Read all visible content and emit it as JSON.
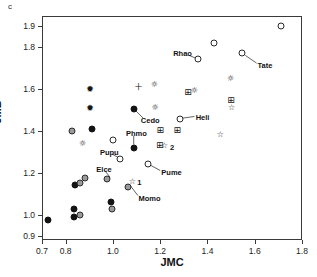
{
  "panel_label": "c",
  "title": "",
  "chart_data": {
    "type": "scatter",
    "title": "",
    "xlabel": "JMC",
    "ylabel": "JMB",
    "xlim": [
      0.7,
      1.8
    ],
    "ylim": [
      0.88,
      1.95
    ],
    "grid": false,
    "legend": "none",
    "xticks": [
      0.7,
      0.8,
      1.0,
      1.2,
      1.4,
      1.6,
      1.8
    ],
    "xtick_labels": [
      "0.7",
      "0.8",
      "1.0",
      "1.2",
      "1.4",
      "1.6",
      "1.8"
    ],
    "yticks": [
      1.9,
      1.8,
      1.6,
      1.4,
      1.2,
      1.0,
      0.9
    ],
    "ytick_labels": [
      "1.9",
      "1.8",
      "1.6",
      "1.4",
      "1.2",
      "1.0",
      "0.9"
    ],
    "marker_types": {
      "circle-filled": "filled black circle",
      "circle-grey": "grey filled circle",
      "circle-open": "open circle",
      "asterisk-filled": "filled asterisk",
      "plus": "plus sign",
      "sun-open": "open sun / gear star",
      "grid-square": "crossed square",
      "star-open": "open five point star"
    },
    "points": [
      {
        "x": 0.725,
        "y": 0.975,
        "marker": "circle-filled",
        "label": ""
      },
      {
        "x": 0.835,
        "y": 1.03,
        "marker": "circle-filled",
        "label": ""
      },
      {
        "x": 0.835,
        "y": 0.99,
        "marker": "circle-filled",
        "label": ""
      },
      {
        "x": 0.838,
        "y": 1.142,
        "marker": "circle-filled",
        "label": ""
      },
      {
        "x": 0.862,
        "y": 0.998,
        "marker": "circle-grey",
        "label": ""
      },
      {
        "x": 0.862,
        "y": 1.15,
        "marker": "circle-grey",
        "label": ""
      },
      {
        "x": 0.88,
        "y": 1.178,
        "marker": "circle-grey",
        "label": ""
      },
      {
        "x": 0.825,
        "y": 1.4,
        "marker": "circle-grey",
        "label": ""
      },
      {
        "x": 0.872,
        "y": 1.338,
        "marker": "sun-open",
        "label": ""
      },
      {
        "x": 0.903,
        "y": 1.512,
        "marker": "asterisk-filled",
        "label": ""
      },
      {
        "x": 0.903,
        "y": 1.6,
        "marker": "asterisk-filled",
        "label": ""
      },
      {
        "x": 0.912,
        "y": 1.408,
        "marker": "circle-filled",
        "label": ""
      },
      {
        "x": 0.998,
        "y": 1.03,
        "marker": "circle-grey",
        "label": ""
      },
      {
        "x": 0.99,
        "y": 1.063,
        "marker": "circle-filled",
        "label": ""
      },
      {
        "x": 0.975,
        "y": 1.17,
        "marker": "circle-grey",
        "label": ""
      },
      {
        "x": 1.0,
        "y": 1.36,
        "marker": "circle-open",
        "label": ""
      },
      {
        "x": 1.028,
        "y": 1.265,
        "marker": "circle-open",
        "label": "Pupu"
      },
      {
        "x": 1.062,
        "y": 1.135,
        "marker": "circle-grey",
        "label": "Momo"
      },
      {
        "x": 1.082,
        "y": 1.155,
        "marker": "star-open",
        "label": "1"
      },
      {
        "x": 1.088,
        "y": 1.32,
        "marker": "circle-filled",
        "label": "Phmo"
      },
      {
        "x": 1.09,
        "y": 1.505,
        "marker": "circle-filled",
        "label": "Cedo"
      },
      {
        "x": 1.108,
        "y": 1.612,
        "marker": "plus",
        "label": ""
      },
      {
        "x": 1.175,
        "y": 1.622,
        "marker": "sun-open",
        "label": ""
      },
      {
        "x": 1.178,
        "y": 1.512,
        "marker": "sun-open",
        "label": ""
      },
      {
        "x": 1.148,
        "y": 1.243,
        "marker": "circle-open",
        "label": "Pume"
      },
      {
        "x": 1.198,
        "y": 1.335,
        "marker": "grid-square",
        "label": ""
      },
      {
        "x": 1.2,
        "y": 1.405,
        "marker": "grid-square",
        "label": ""
      },
      {
        "x": 1.218,
        "y": 1.33,
        "marker": "star-open",
        "label": "2"
      },
      {
        "x": 1.272,
        "y": 1.405,
        "marker": "grid-square",
        "label": ""
      },
      {
        "x": 1.282,
        "y": 1.46,
        "marker": "circle-open",
        "label": "Heli"
      },
      {
        "x": 1.318,
        "y": 1.585,
        "marker": "grid-square",
        "label": ""
      },
      {
        "x": 1.345,
        "y": 1.59,
        "marker": "sun-open",
        "label": ""
      },
      {
        "x": 1.362,
        "y": 1.745,
        "marker": "circle-open",
        "label": "Rhao"
      },
      {
        "x": 1.428,
        "y": 1.822,
        "marker": "circle-open",
        "label": ""
      },
      {
        "x": 1.455,
        "y": 1.38,
        "marker": "star-open",
        "label": ""
      },
      {
        "x": 1.498,
        "y": 1.65,
        "marker": "sun-open",
        "label": ""
      },
      {
        "x": 1.5,
        "y": 1.548,
        "marker": "grid-square",
        "label": ""
      },
      {
        "x": 1.502,
        "y": 1.512,
        "marker": "star-open",
        "label": ""
      },
      {
        "x": 1.548,
        "y": 1.772,
        "marker": "circle-open",
        "label": "Tate"
      },
      {
        "x": 1.712,
        "y": 1.9,
        "marker": "circle-open",
        "label": ""
      }
    ],
    "annotations": [
      {
        "text": "Rhao",
        "x": 1.255,
        "y": 1.772
      },
      {
        "text": "Tate",
        "x": 1.612,
        "y": 1.718
      },
      {
        "text": "Cedo",
        "x": 1.118,
        "y": 1.452
      },
      {
        "text": "Heli",
        "x": 1.35,
        "y": 1.468
      },
      {
        "text": "Phmo",
        "x": 1.055,
        "y": 1.392
      },
      {
        "text": "Pupu",
        "x": 0.945,
        "y": 1.3
      },
      {
        "text": "Elce",
        "x": 0.93,
        "y": 1.218
      },
      {
        "text": "Pume",
        "x": 1.205,
        "y": 1.205
      },
      {
        "text": "Momo",
        "x": 1.108,
        "y": 1.082
      },
      {
        "text": "1",
        "x": 1.103,
        "y": 1.157
      },
      {
        "text": "2",
        "x": 1.242,
        "y": 1.325
      }
    ]
  }
}
